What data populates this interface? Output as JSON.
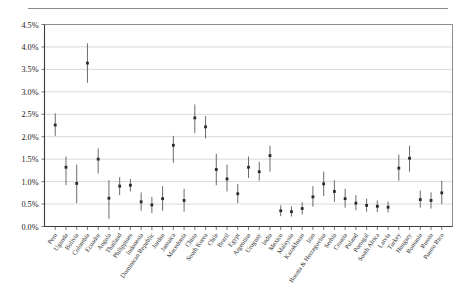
{
  "figure": {
    "has_top_rule": true,
    "background_color": "#ffffff",
    "marker_color": "#2a2a2a",
    "whisker_color": "#5a5a5a",
    "grid_color": "#c9c9c9",
    "axis_color": "#3a3a3a"
  },
  "chart_data": {
    "type": "scatter",
    "title": "",
    "subtitle": "",
    "xlabel": "",
    "ylabel": "",
    "ylim": [
      0.0,
      4.5
    ],
    "ytick_values": [
      0.0,
      0.5,
      1.0,
      1.5,
      2.0,
      2.5,
      3.0,
      3.5,
      4.0,
      4.5
    ],
    "ytick_labels": [
      "0.0%",
      "0.5%",
      "1.0%",
      "1.5%",
      "2.0%",
      "2.5%",
      "3.0%",
      "3.5%",
      "4.0%",
      "4.5%"
    ],
    "grid": "horizontal",
    "legend": "none",
    "error_bars": "vertical confidence intervals",
    "categories": [
      "Peru",
      "Uganda",
      "Bolivia",
      "Colombia",
      "Ecuador",
      "Angola",
      "Thailand",
      "Philippines",
      "Indonesia",
      "Dominican Republic",
      "Jordan",
      "Jamaica",
      "Macedonia",
      "China",
      "South Korea",
      "Chile",
      "Brazil",
      "Egypt",
      "Argentina",
      "Uruguay",
      "India",
      "Mexico",
      "Malaysia",
      "Kazakhstan",
      "Iran",
      "Bosnia & Herzegovina",
      "Serbia",
      "Croatia",
      "Poland",
      "Portugal",
      "South Africa",
      "Latvia",
      "Turkey",
      "Hungary",
      "Romania",
      "Russia",
      "Puerto Rico"
    ],
    "values": [
      2.26,
      1.32,
      0.96,
      3.64,
      1.5,
      0.63,
      0.9,
      0.92,
      0.55,
      0.48,
      0.62,
      1.81,
      0.58,
      2.42,
      2.22,
      1.27,
      1.06,
      0.73,
      1.32,
      1.22,
      1.58,
      0.35,
      0.33,
      0.4,
      0.66,
      0.95,
      0.78,
      0.62,
      0.52,
      0.47,
      0.45,
      0.43,
      1.3,
      1.52,
      0.6,
      0.58,
      0.75
    ],
    "ci_low": [
      2.02,
      0.92,
      0.52,
      3.2,
      1.18,
      0.17,
      0.7,
      0.78,
      0.35,
      0.3,
      0.35,
      1.42,
      0.33,
      2.08,
      1.96,
      0.92,
      0.78,
      0.52,
      1.08,
      1.02,
      1.22,
      0.23,
      0.22,
      0.27,
      0.44,
      0.68,
      0.55,
      0.42,
      0.36,
      0.33,
      0.32,
      0.31,
      1.02,
      1.22,
      0.42,
      0.4,
      0.5
    ],
    "ci_high": [
      2.52,
      1.56,
      1.38,
      4.08,
      1.74,
      1.03,
      1.1,
      1.06,
      0.76,
      0.66,
      0.9,
      2.02,
      0.84,
      2.72,
      2.46,
      1.62,
      1.38,
      0.95,
      1.56,
      1.44,
      1.8,
      0.47,
      0.45,
      0.54,
      0.9,
      1.22,
      1.03,
      0.84,
      0.7,
      0.62,
      0.58,
      0.56,
      1.6,
      1.8,
      0.8,
      0.76,
      1.02
    ]
  }
}
